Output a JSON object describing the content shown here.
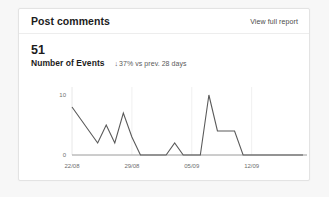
{
  "card": {
    "title": "Post comments",
    "header_link": "View full report"
  },
  "metric": {
    "value": "51",
    "label": "Number of Events",
    "delta_arrow": "↓",
    "delta_text": "37% vs prev. 28 days"
  },
  "colors": {
    "line": "#5a5a5a",
    "axis": "#9a9a9a",
    "grid": "#f0f0f0",
    "text": "#1c1c1c",
    "muted": "#6e6e6e",
    "card_border": "#e3e3e3",
    "page_background": "#f7f7f7"
  },
  "chart_data": {
    "type": "line",
    "title": "",
    "xlabel": "",
    "ylabel": "",
    "ylim": [
      0,
      10
    ],
    "yticks": [
      0,
      10
    ],
    "ytick_labels": [
      "0",
      "10"
    ],
    "grid": true,
    "legend": "none",
    "xtick_labels": [
      "22/08",
      "29/08",
      "05/09",
      "12/09"
    ],
    "xtick_indices": [
      0,
      7,
      14,
      21
    ],
    "x": [
      "22/08",
      "23/08",
      "24/08",
      "25/08",
      "26/08",
      "27/08",
      "28/08",
      "29/08",
      "30/08",
      "31/08",
      "01/09",
      "02/09",
      "03/09",
      "04/09",
      "05/09",
      "06/09",
      "07/09",
      "08/09",
      "09/09",
      "10/09",
      "11/09",
      "12/09",
      "13/09",
      "14/09",
      "15/09",
      "16/09",
      "17/09",
      "18/09"
    ],
    "values": [
      8,
      6,
      4,
      2,
      5,
      2,
      7,
      3,
      0,
      0,
      0,
      0,
      2,
      0,
      0,
      0,
      10,
      4,
      4,
      4,
      0,
      0,
      0,
      0,
      0,
      0,
      0,
      0
    ]
  }
}
